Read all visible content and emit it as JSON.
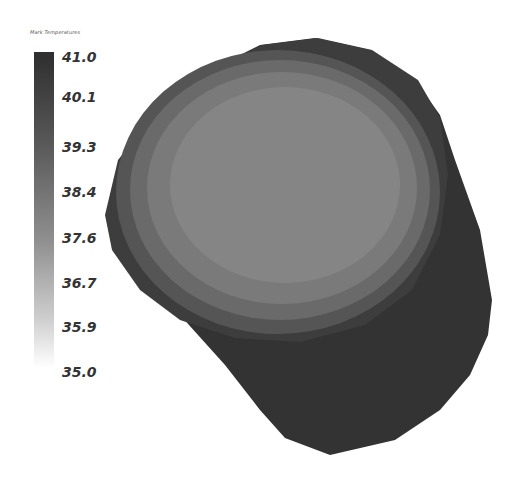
{
  "legend": {
    "title": "Mark Temperatures",
    "max": 41.0,
    "min": 35.0,
    "colors": {
      "high": "#2e2e2e",
      "low": "#ffffff"
    },
    "ticks": [
      "41.0",
      "40.1",
      "39.3",
      "38.4",
      "37.6",
      "36.7",
      "35.9",
      "35.0"
    ]
  },
  "model": {
    "description": "3D cylinder temperature contour render",
    "colors": {
      "side": "#333333",
      "rim": "#3d3d3d",
      "band1": "#555555",
      "band2": "#6a6a6a",
      "band3": "#7a7a7a",
      "core": "#858585"
    }
  }
}
